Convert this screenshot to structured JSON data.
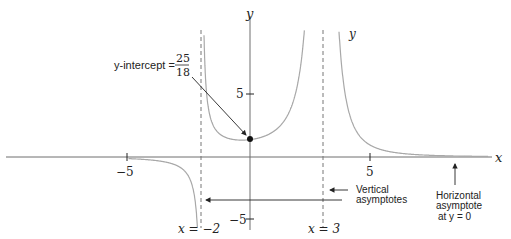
{
  "chart_data": {
    "type": "line",
    "title": "",
    "function": "y = 25 / ((x + 2)(x - 3)^2)",
    "xlabel": "x",
    "ylabel": "y",
    "curve_label": "y",
    "xlim": [
      -10.2,
      10
    ],
    "ylim": [
      -6.5,
      12.5
    ],
    "grid": false,
    "x_ticks": [
      {
        "value": -5,
        "label": "−5"
      },
      {
        "value": 5,
        "label": "5"
      }
    ],
    "y_ticks": [
      {
        "value": 5,
        "label": "5"
      },
      {
        "value": -5,
        "label": "−5"
      }
    ],
    "vertical_asymptotes": [
      {
        "x": -2,
        "label": "x = −2"
      },
      {
        "x": 3,
        "label": "x = 3"
      }
    ],
    "horizontal_asymptote": {
      "y": 0
    },
    "y_intercept": {
      "x": 0,
      "y": 1.3889,
      "label_prefix": "y-intercept =",
      "numerator": "25",
      "denominator": "18"
    },
    "annotations": [
      {
        "text": "Vertical asymptotes"
      },
      {
        "text": "Horizontal asymptote at y = 0"
      }
    ],
    "colors": {
      "curve": "#a8a8a8",
      "axis": "#6e6e6e",
      "text": "#222222",
      "asymptote": "#777777"
    }
  },
  "labels": {
    "x_axis": "x",
    "y_axis": "y",
    "curve": "y",
    "tick_x_neg5": "−5",
    "tick_x_5": "5",
    "tick_y_5": "5",
    "tick_y_neg5": "−5",
    "asym_left": "x = −2",
    "asym_right": "x = 3",
    "intercept_prefix": "y-intercept =",
    "intercept_num": "25",
    "intercept_den": "18",
    "vertical_line1": "Vertical",
    "vertical_line2": "asymptotes",
    "horiz_line1": "Horizontal",
    "horiz_line2": "asymptote",
    "horiz_line3": "at y = 0"
  }
}
